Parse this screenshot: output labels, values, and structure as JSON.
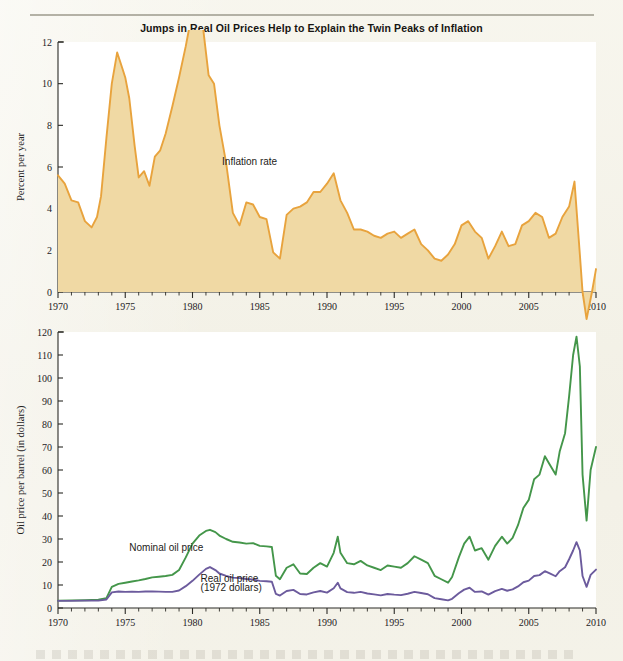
{
  "figure": {
    "title": "Jumps in Real Oil Prices Help to Explain the Twin Peaks of Inflation"
  },
  "chart_data": [
    {
      "type": "area",
      "id": "inflation-panel",
      "title": "",
      "xlabel": "",
      "ylabel": "Percent per year",
      "xlim": [
        1970,
        2010
      ],
      "ylim": [
        0,
        12
      ],
      "ytick_labels": [
        "0",
        "2",
        "4",
        "6",
        "8",
        "10",
        "12"
      ],
      "yticks": [
        0,
        2,
        4,
        6,
        8,
        10,
        12
      ],
      "xtick_labels": [
        "1970",
        "1975",
        "1980",
        "1985",
        "1990",
        "1995",
        "2000",
        "2005",
        "2010"
      ],
      "xticks": [
        1970,
        1975,
        1980,
        1985,
        1990,
        1995,
        2000,
        2005,
        2010
      ],
      "minor_xtick_step": 1,
      "grid": false,
      "annotations": [
        {
          "text": "Inflation rate",
          "x": 1982.2,
          "y": 6.1
        }
      ],
      "series": [
        {
          "name": "Inflation rate",
          "color": "#e8a33d",
          "fill": "#f0d9a4",
          "x": [
            1970.0,
            1970.5,
            1971.0,
            1971.5,
            1972.0,
            1972.5,
            1972.9,
            1973.2,
            1973.6,
            1974.0,
            1974.4,
            1974.8,
            1975.0,
            1975.3,
            1975.7,
            1976.0,
            1976.4,
            1976.8,
            1977.2,
            1977.6,
            1978.0,
            1978.5,
            1979.0,
            1979.5,
            1980.0,
            1980.4,
            1980.8,
            1981.2,
            1981.6,
            1982.0,
            1982.5,
            1983.0,
            1983.5,
            1984.0,
            1984.5,
            1985.0,
            1985.5,
            1986.0,
            1986.5,
            1987.0,
            1987.5,
            1988.0,
            1988.5,
            1989.0,
            1989.5,
            1990.0,
            1990.5,
            1991.0,
            1991.5,
            1992.0,
            1992.5,
            1993.0,
            1993.5,
            1994.0,
            1994.5,
            1995.0,
            1995.5,
            1996.0,
            1996.5,
            1997.0,
            1997.5,
            1998.0,
            1998.5,
            1999.0,
            1999.5,
            2000.0,
            2000.5,
            2001.0,
            2001.5,
            2002.0,
            2002.5,
            2003.0,
            2003.5,
            2004.0,
            2004.5,
            2005.0,
            2005.5,
            2006.0,
            2006.5,
            2007.0,
            2007.5,
            2008.0,
            2008.4,
            2008.8,
            2009.0,
            2009.3,
            2009.7,
            2010.0
          ],
          "y": [
            5.6,
            5.2,
            4.4,
            4.3,
            3.4,
            3.1,
            3.6,
            4.6,
            7.4,
            10.0,
            11.5,
            10.7,
            10.3,
            9.3,
            7.0,
            5.5,
            5.8,
            5.1,
            6.5,
            6.8,
            7.6,
            8.9,
            10.3,
            11.8,
            13.5,
            13.9,
            12.6,
            10.4,
            10.0,
            8.0,
            6.2,
            3.8,
            3.2,
            4.3,
            4.2,
            3.6,
            3.5,
            1.9,
            1.6,
            3.7,
            4.0,
            4.1,
            4.3,
            4.8,
            4.8,
            5.2,
            5.7,
            4.4,
            3.8,
            3.0,
            3.0,
            2.9,
            2.7,
            2.6,
            2.8,
            2.9,
            2.6,
            2.8,
            3.0,
            2.3,
            2.0,
            1.6,
            1.5,
            1.8,
            2.3,
            3.2,
            3.4,
            2.9,
            2.6,
            1.6,
            2.2,
            2.9,
            2.2,
            2.3,
            3.2,
            3.4,
            3.8,
            3.6,
            2.6,
            2.8,
            3.6,
            4.1,
            5.3,
            1.8,
            0.0,
            -1.3,
            0.0,
            1.1,
            1.5
          ]
        }
      ]
    },
    {
      "type": "line",
      "id": "oil-price-panel",
      "title": "",
      "xlabel": "",
      "ylabel": "Oil price per barrel (in dollars)",
      "xlim": [
        1970,
        2010
      ],
      "ylim": [
        0,
        120
      ],
      "ytick_labels": [
        "0",
        "10",
        "20",
        "30",
        "40",
        "50",
        "60",
        "70",
        "80",
        "90",
        "100",
        "110",
        "120"
      ],
      "yticks": [
        0,
        10,
        20,
        30,
        40,
        50,
        60,
        70,
        80,
        90,
        100,
        110,
        120
      ],
      "xtick_labels": [
        "1970",
        "1975",
        "1980",
        "1985",
        "1990",
        "1995",
        "2000",
        "2005",
        "2010"
      ],
      "xticks": [
        1970,
        1975,
        1980,
        1985,
        1990,
        1995,
        2000,
        2005,
        2010
      ],
      "minor_xtick_step": 1,
      "grid": false,
      "annotations": [
        {
          "text": "Nominal oil price",
          "x": 1975.3,
          "y": 25.0
        },
        {
          "text": "Real oil price",
          "x": 1980.6,
          "y": 11.5
        },
        {
          "text": "(1972 dollars)",
          "x": 1980.6,
          "y": 7.3
        }
      ],
      "series": [
        {
          "name": "Nominal oil price",
          "color": "#44964a",
          "x": [
            1970.0,
            1971.0,
            1972.0,
            1973.0,
            1973.6,
            1974.0,
            1974.5,
            1975.0,
            1975.5,
            1976.0,
            1976.5,
            1977.0,
            1977.5,
            1978.0,
            1978.5,
            1979.0,
            1979.5,
            1980.0,
            1980.5,
            1981.0,
            1981.3,
            1981.7,
            1982.0,
            1982.5,
            1983.0,
            1983.5,
            1984.0,
            1984.5,
            1985.0,
            1985.5,
            1985.9,
            1986.2,
            1986.5,
            1987.0,
            1987.5,
            1988.0,
            1988.5,
            1989.0,
            1989.5,
            1990.0,
            1990.5,
            1990.8,
            1991.0,
            1991.5,
            1992.0,
            1992.5,
            1993.0,
            1993.5,
            1994.0,
            1994.5,
            1995.0,
            1995.5,
            1996.0,
            1996.5,
            1997.0,
            1997.5,
            1998.0,
            1998.5,
            1999.0,
            1999.3,
            1999.8,
            2000.2,
            2000.6,
            2001.0,
            2001.5,
            2002.0,
            2002.5,
            2003.0,
            2003.4,
            2003.8,
            2004.2,
            2004.6,
            2005.0,
            2005.4,
            2005.8,
            2006.2,
            2006.6,
            2007.0,
            2007.3,
            2007.7,
            2008.0,
            2008.3,
            2008.55,
            2008.8,
            2009.0,
            2009.3,
            2009.6,
            2010.0
          ],
          "y": [
            3.2,
            3.3,
            3.4,
            3.6,
            4.3,
            9.2,
            10.5,
            11.0,
            11.5,
            12.0,
            12.6,
            13.3,
            13.6,
            13.9,
            14.4,
            16.5,
            22.0,
            28.0,
            31.5,
            33.5,
            34.0,
            33.0,
            31.5,
            30.0,
            28.8,
            28.5,
            28.0,
            28.2,
            27.0,
            26.8,
            26.5,
            14.0,
            12.5,
            17.5,
            19.0,
            15.0,
            14.8,
            17.5,
            19.5,
            18.0,
            24.0,
            31.0,
            24.0,
            19.5,
            19.0,
            20.5,
            18.5,
            17.5,
            16.5,
            18.5,
            18.0,
            17.5,
            19.5,
            22.5,
            21.0,
            19.5,
            14.0,
            12.5,
            11.0,
            13.5,
            22.0,
            28.0,
            31.0,
            25.0,
            26.0,
            21.0,
            27.0,
            31.0,
            28.0,
            30.5,
            36.0,
            43.5,
            47.0,
            56.0,
            58.0,
            66.0,
            62.0,
            58.0,
            68.0,
            76.0,
            92.0,
            110.0,
            118.0,
            105.0,
            58.0,
            38.0,
            60.0,
            70.0,
            76.0
          ]
        },
        {
          "name": "Real oil price (1972 dollars)",
          "color": "#6c5b9d",
          "x": [
            1970.0,
            1971.0,
            1972.0,
            1973.0,
            1973.6,
            1974.0,
            1974.5,
            1975.0,
            1975.5,
            1976.0,
            1976.5,
            1977.0,
            1977.5,
            1978.0,
            1978.5,
            1979.0,
            1979.5,
            1980.0,
            1980.5,
            1981.0,
            1981.3,
            1981.7,
            1982.0,
            1982.5,
            1983.0,
            1983.5,
            1984.0,
            1984.5,
            1985.0,
            1985.5,
            1985.9,
            1986.2,
            1986.5,
            1987.0,
            1987.5,
            1988.0,
            1988.5,
            1989.0,
            1989.5,
            1990.0,
            1990.5,
            1990.8,
            1991.0,
            1991.5,
            1992.0,
            1992.5,
            1993.0,
            1993.5,
            1994.0,
            1994.5,
            1995.0,
            1995.5,
            1996.0,
            1996.5,
            1997.0,
            1997.5,
            1998.0,
            1998.5,
            1999.0,
            1999.3,
            1999.8,
            2000.2,
            2000.6,
            2001.0,
            2001.5,
            2002.0,
            2002.5,
            2003.0,
            2003.4,
            2003.8,
            2004.2,
            2004.6,
            2005.0,
            2005.4,
            2005.8,
            2006.2,
            2006.6,
            2007.0,
            2007.3,
            2007.7,
            2008.0,
            2008.3,
            2008.55,
            2008.8,
            2009.0,
            2009.3,
            2009.6,
            2010.0
          ],
          "y": [
            3.1,
            3.1,
            3.2,
            3.2,
            3.7,
            6.8,
            7.2,
            7.0,
            7.1,
            7.0,
            7.2,
            7.2,
            7.1,
            7.0,
            7.0,
            7.6,
            9.5,
            11.8,
            14.5,
            17.0,
            17.8,
            16.5,
            15.0,
            14.0,
            13.2,
            13.0,
            12.6,
            12.4,
            11.8,
            11.6,
            11.4,
            6.1,
            5.4,
            7.4,
            7.9,
            6.1,
            5.9,
            6.8,
            7.4,
            6.7,
            8.6,
            11.0,
            8.5,
            6.9,
            6.6,
            7.0,
            6.3,
            5.9,
            5.5,
            6.1,
            5.8,
            5.6,
            6.2,
            7.0,
            6.5,
            6.0,
            4.3,
            3.8,
            3.3,
            4.0,
            6.4,
            8.0,
            8.8,
            7.0,
            7.2,
            5.8,
            7.3,
            8.3,
            7.5,
            8.1,
            9.4,
            11.2,
            11.9,
            13.9,
            14.3,
            16.0,
            14.9,
            13.8,
            16.0,
            17.7,
            21.2,
            25.0,
            28.6,
            25.0,
            13.9,
            9.2,
            14.4,
            16.7,
            18.0
          ]
        }
      ]
    }
  ]
}
